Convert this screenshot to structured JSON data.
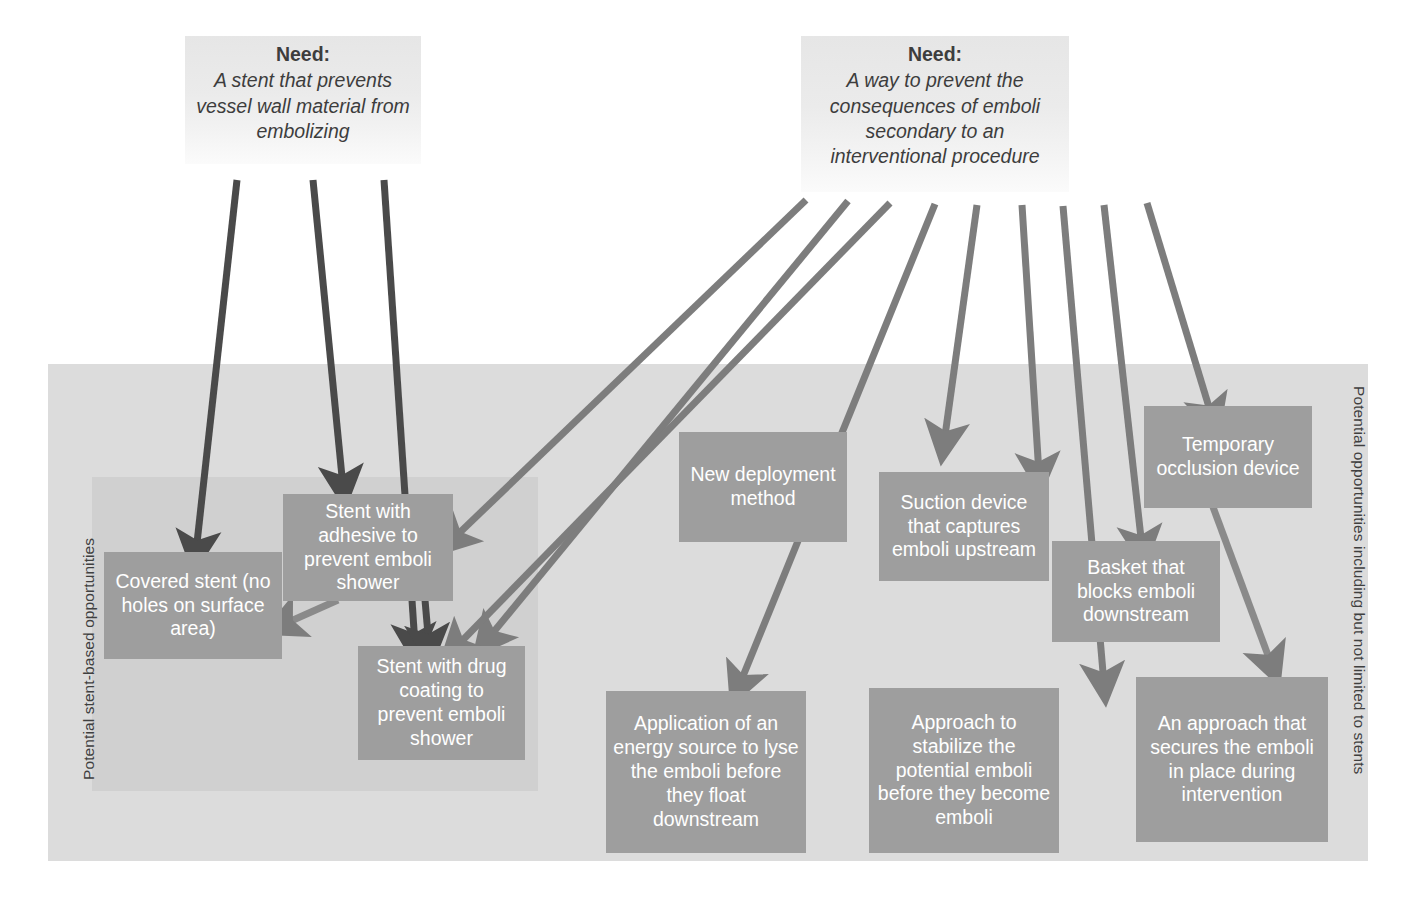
{
  "diagram": {
    "colors": {
      "idea_box": "#9e9e9e",
      "idea_text": "#ffffff",
      "need_box_top": "#e6e6e6",
      "need_box_bottom": "#fbfbfb",
      "need_text": "#3d3d3d",
      "panel_outer": "#dcdcdc",
      "panel_inner": "#d0d0d0",
      "arrow_dark": "#4a4a4a",
      "arrow_mid": "#7d7d7d",
      "page_background": "#ffffff"
    },
    "needs": [
      {
        "id": "need-stent",
        "title": "Need:",
        "body": "A stent that prevents vessel wall material from embolizing"
      },
      {
        "id": "need-emboli",
        "title": "Need:",
        "body": "A way to prevent the consequences of emboli secondary to an interventional procedure"
      }
    ],
    "regions": [
      {
        "id": "region-stent-based",
        "label": "Potential stent-based opportunities"
      },
      {
        "id": "region-all",
        "label": "Potential opportunities including but not limited to stents"
      }
    ],
    "ideas": [
      {
        "id": "covered-stent",
        "label": "Covered stent (no holes on surface area)"
      },
      {
        "id": "stent-adhesive",
        "label": "Stent with adhesive to prevent emboli shower"
      },
      {
        "id": "stent-drug-coating",
        "label": "Stent with drug coating to prevent emboli shower"
      },
      {
        "id": "new-deployment",
        "label": "New deployment method"
      },
      {
        "id": "suction-device",
        "label": "Suction device that captures emboli upstream"
      },
      {
        "id": "temporary-occlusion",
        "label": "Temporary occlusion device"
      },
      {
        "id": "basket-blocks",
        "label": "Basket that blocks emboli downstream"
      },
      {
        "id": "energy-source",
        "label": "Application of an energy source to lyse the emboli before they float downstream"
      },
      {
        "id": "stabilize-emboli",
        "label": "Approach to stabilize the potential emboli before they become emboli"
      },
      {
        "id": "secure-emboli",
        "label": "An approach that secures the emboli in place during intervention"
      }
    ],
    "connections": [
      {
        "from": "need-stent",
        "to": "covered-stent"
      },
      {
        "from": "need-stent",
        "to": "stent-adhesive"
      },
      {
        "from": "need-stent",
        "to": "stent-drug-coating"
      },
      {
        "from": "need-emboli",
        "to": "stent-adhesive"
      },
      {
        "from": "need-emboli",
        "to": "stent-drug-coating"
      },
      {
        "from": "need-emboli",
        "to": "new-deployment"
      },
      {
        "from": "need-emboli",
        "to": "energy-source"
      },
      {
        "from": "need-emboli",
        "to": "suction-device"
      },
      {
        "from": "need-emboli",
        "to": "stabilize-emboli"
      },
      {
        "from": "need-emboli",
        "to": "basket-blocks"
      },
      {
        "from": "need-emboli",
        "to": "temporary-occlusion"
      },
      {
        "from": "stent-adhesive",
        "to": "covered-stent"
      },
      {
        "from": "stent-adhesive",
        "to": "stent-drug-coating"
      },
      {
        "from": "temporary-occlusion",
        "to": "secure-emboli"
      }
    ]
  }
}
